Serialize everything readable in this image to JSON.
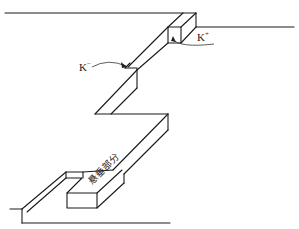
{
  "diagram": {
    "type": "3d-line-drawing",
    "labels": {
      "k_minus": {
        "base": "K",
        "sup": "−"
      },
      "k_plus": {
        "base": "K",
        "sup": "+"
      },
      "overhang": "悬垂部分"
    },
    "colors": {
      "stroke": "#1a1a1a",
      "background": "#ffffff"
    }
  }
}
